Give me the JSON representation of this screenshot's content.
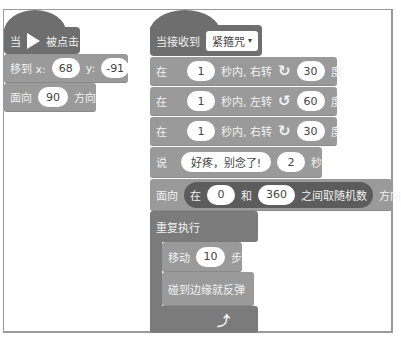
{
  "left_script": {
    "hat": {
      "prefix": "当",
      "icon": "green-flag-icon",
      "suffix": "被点击"
    },
    "goto": {
      "label": "移到 x:",
      "x": "68",
      "y_label": "y:",
      "y": "-91"
    },
    "point": {
      "label": "面向",
      "value": "90",
      "suffix": "方向"
    }
  },
  "right_script": {
    "hat": {
      "label": "当接收到",
      "message": "紧箍咒",
      "dropdown_arrow": "▾"
    },
    "turns": [
      {
        "prefix": "在",
        "secs": "1",
        "mid": "秒内, 右转",
        "icon": "rotate-clockwise-icon",
        "glyph": "↻",
        "deg": "30",
        "suffix": "度"
      },
      {
        "prefix": "在",
        "secs": "1",
        "mid": "秒内, 左转",
        "icon": "rotate-counterclockwise-icon",
        "glyph": "↺",
        "deg": "60",
        "suffix": "度"
      },
      {
        "prefix": "在",
        "secs": "1",
        "mid": "秒内, 右转",
        "icon": "rotate-clockwise-icon",
        "glyph": "↻",
        "deg": "30",
        "suffix": "度"
      }
    ],
    "say": {
      "label": "说",
      "text": "好疼，别念了!",
      "secs": "2",
      "suffix": "秒"
    },
    "point_random": {
      "label": "面向",
      "r_prefix": "在",
      "from": "0",
      "r_mid": "和",
      "to": "360",
      "r_suffix": "之间取随机数",
      "suffix": "方向"
    },
    "forever": {
      "label": "重复执行",
      "move": {
        "label": "移动",
        "steps": "10",
        "suffix": "步"
      },
      "bounce": {
        "label": "碰到边缘就反弹"
      },
      "loop_glyph": "⤴"
    }
  },
  "colors": {
    "hat": "#6e6e6e",
    "motion": "#9a9a9a",
    "control": "#7b7b7b",
    "operator": "#5c5c5c",
    "frame": "#9a9a9a"
  }
}
